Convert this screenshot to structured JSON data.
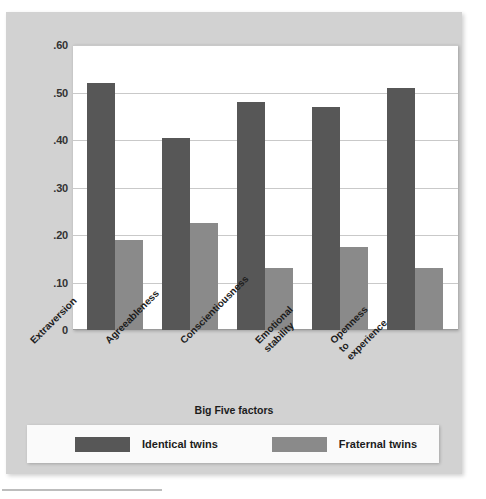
{
  "chart_data": {
    "type": "bar",
    "title": "",
    "xlabel": "Big Five factors",
    "ylabel": "Correlation of scores",
    "categories": [
      "Extraversion",
      "Agreeableness",
      "Conscientiousness",
      "Emotional\nstability",
      "Openness\nto\nexperience"
    ],
    "series": [
      {
        "name": "Identical twins",
        "color": "#575757",
        "values": [
          0.52,
          0.405,
          0.48,
          0.47,
          0.51
        ]
      },
      {
        "name": "Fraternal twins",
        "color": "#8a8a8a",
        "values": [
          0.19,
          0.225,
          0.13,
          0.175,
          0.13
        ]
      }
    ],
    "ylim": [
      0,
      0.6
    ],
    "ytick_labels": [
      ".60",
      ".50",
      ".40",
      ".30",
      ".20",
      ".10",
      "0"
    ],
    "ytick_values": [
      0.6,
      0.5,
      0.4,
      0.3,
      0.2,
      0.1,
      0
    ],
    "grid": true,
    "legend_position": "bottom"
  },
  "legend": {
    "items": [
      {
        "label": "Identical twins",
        "color": "#575757"
      },
      {
        "label": "Fraternal twins",
        "color": "#8a8a8a"
      }
    ]
  },
  "colors": {
    "card_background": "#d2d2d2",
    "plot_background": "#ffffff",
    "gridline": "#c9c9c9",
    "identical": "#575757",
    "fraternal": "#8a8a8a"
  }
}
